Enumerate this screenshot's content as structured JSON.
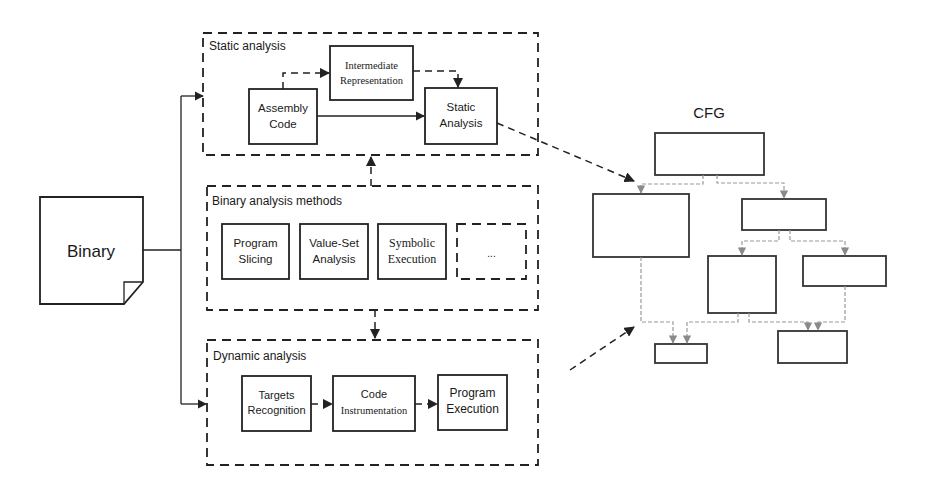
{
  "source": {
    "label": "Binary"
  },
  "static_analysis": {
    "title": "Static analysis",
    "nodes": [
      {
        "line1": "Assembly",
        "line2": "Code"
      },
      {
        "line1": "Intermediate",
        "line2": "Representation"
      },
      {
        "line1": "Static",
        "line2": "Analysis"
      }
    ]
  },
  "binary_methods": {
    "title": "Binary analysis methods",
    "nodes": [
      {
        "line1": "Program",
        "line2": "Slicing"
      },
      {
        "line1": "Value-Set",
        "line2": "Analysis"
      },
      {
        "line1": "Symbolic",
        "line2": "Execution"
      },
      {
        "line1": "...",
        "line2": ""
      }
    ]
  },
  "dynamic_analysis": {
    "title": "Dynamic analysis",
    "nodes": [
      {
        "line1": "Targets",
        "line2": "Recognition"
      },
      {
        "line1": "Code",
        "line2": "Instrumentation"
      },
      {
        "line1": "Program",
        "line2": "Execution"
      }
    ]
  },
  "cfg": {
    "title": "CFG",
    "node_count": 8
  },
  "colors": {
    "stroke": "#222222",
    "cfg_edges": "#9a9a9a",
    "background": "#ffffff"
  }
}
